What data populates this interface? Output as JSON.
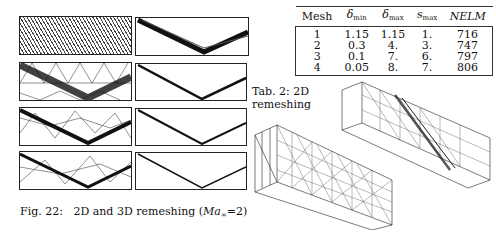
{
  "figure": {
    "caption_label": "Fig. 22:",
    "caption_text": "2D and 3D remeshing (",
    "caption_math": "Ma",
    "caption_sub": "∞",
    "caption_eq": "=2)",
    "panels_left": [
      "initial fine mesh",
      "remesh 2",
      "remesh 3",
      "remesh 4"
    ],
    "panels_right": [
      "solution 1",
      "solution 2",
      "solution 3",
      "solution 4"
    ]
  },
  "table": {
    "label": "Tab. 2:  2D",
    "label2": "remeshing",
    "headers": [
      "Mesh",
      "δ",
      "min",
      "δ",
      "max",
      "s",
      "max",
      "NELM"
    ],
    "rows": [
      [
        "1",
        "1.15",
        "1.15",
        "1.",
        "716"
      ],
      [
        "2",
        "0.3",
        "4.",
        "3.",
        "747"
      ],
      [
        "3",
        "0.1",
        "7.",
        "6.",
        "797"
      ],
      [
        "4",
        "0.05",
        "8.",
        "7.",
        "806"
      ]
    ]
  }
}
